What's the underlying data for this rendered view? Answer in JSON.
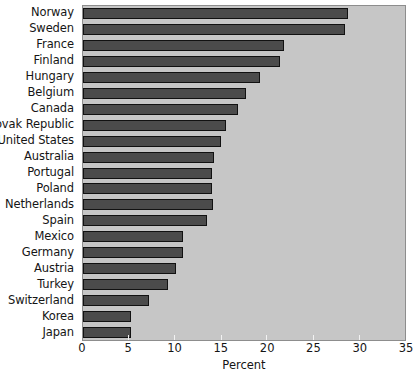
{
  "chart_data": {
    "type": "bar",
    "orientation": "horizontal",
    "title": "",
    "xlabel": "Percent",
    "ylabel": "",
    "xlim": [
      0,
      35
    ],
    "xticks": [
      0,
      5,
      10,
      15,
      20,
      25,
      30,
      35
    ],
    "grid": false,
    "legend": null,
    "bar_color": "#4b4b4b",
    "plot_background": "#c6c6c6",
    "categories": [
      "Norway",
      "Sweden",
      "France",
      "Finland",
      "Hungary",
      "Belgium",
      "Canada",
      "Slovak Republic",
      "United States",
      "Australia",
      "Portugal",
      "Poland",
      "Netherlands",
      "Spain",
      "Mexico",
      "Germany",
      "Austria",
      "Turkey",
      "Switzerland",
      "Korea",
      "Japan"
    ],
    "values": [
      28.8,
      28.5,
      21.8,
      21.4,
      19.2,
      17.7,
      16.8,
      15.5,
      15.0,
      14.2,
      14.0,
      14.0,
      14.1,
      13.5,
      10.9,
      10.9,
      10.1,
      9.2,
      7.2,
      5.2,
      5.2
    ]
  }
}
